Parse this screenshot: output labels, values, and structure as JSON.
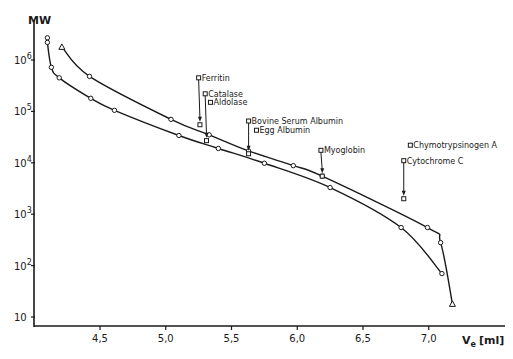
{
  "chart_data": {
    "type": "line",
    "title": "",
    "xlabel": "Ve [ml]",
    "xlabel_main": "V",
    "xlabel_sub": "e",
    "xlabel_unit": "[ml]",
    "ylabel": "MW",
    "yscale": "log",
    "xlim": [
      4.05,
      7.3
    ],
    "ylim": [
      10,
      3000000
    ],
    "grid": false,
    "legend": "none",
    "x_ticks": [
      {
        "value": 4.5,
        "label": "4,5"
      },
      {
        "value": 5.0,
        "label": "5,0"
      },
      {
        "value": 5.5,
        "label": "5,5"
      },
      {
        "value": 6.0,
        "label": "6,0"
      },
      {
        "value": 6.5,
        "label": "6,5"
      },
      {
        "value": 7.0,
        "label": "7,0"
      }
    ],
    "y_ticks": [
      {
        "value": 10,
        "base": "10",
        "exp": ""
      },
      {
        "value": 100,
        "base": "10",
        "exp": "2"
      },
      {
        "value": 1000,
        "base": "10",
        "exp": "3"
      },
      {
        "value": 10000,
        "base": "10",
        "exp": "4"
      },
      {
        "value": 100000,
        "base": "10",
        "exp": "5"
      },
      {
        "value": 1000000,
        "base": "10",
        "exp": "6"
      }
    ],
    "series": [
      {
        "name": "upper curve",
        "marker": "circle",
        "end_marker": "triangle",
        "points": [
          {
            "x": 4.21,
            "y": 1800000,
            "m": "triangle"
          },
          {
            "x": 4.42,
            "y": 480000
          },
          {
            "x": 5.04,
            "y": 70000
          },
          {
            "x": 5.33,
            "y": 35000
          },
          {
            "x": 5.63,
            "y": 17000
          },
          {
            "x": 5.97,
            "y": 8800
          },
          {
            "x": 6.19,
            "y": 5500
          },
          {
            "x": 6.99,
            "y": 550
          },
          {
            "x": 7.09,
            "y": 280
          },
          {
            "x": 7.18,
            "y": 18,
            "m": "triangle"
          }
        ]
      },
      {
        "name": "lower curve",
        "marker": "circle",
        "points": [
          {
            "x": 4.1,
            "y": 2700000
          },
          {
            "x": 4.1,
            "y": 2200000
          },
          {
            "x": 4.13,
            "y": 720000
          },
          {
            "x": 4.19,
            "y": 450000
          },
          {
            "x": 4.43,
            "y": 180000
          },
          {
            "x": 4.61,
            "y": 105000
          },
          {
            "x": 5.1,
            "y": 34000
          },
          {
            "x": 5.4,
            "y": 19000
          },
          {
            "x": 5.75,
            "y": 9800
          },
          {
            "x": 6.25,
            "y": 3300
          },
          {
            "x": 6.79,
            "y": 550
          },
          {
            "x": 7.1,
            "y": 70
          }
        ]
      }
    ],
    "annotations": [
      {
        "label": "Ferritin",
        "label_x": 5.25,
        "label_y": 450000,
        "arrow": true,
        "marker_x": 5.26,
        "marker_y": 55000
      },
      {
        "label": "Catalase",
        "label_x": 5.3,
        "label_y": 220000,
        "arrow": true,
        "marker_x": 5.31,
        "marker_y": 27000
      },
      {
        "label": "Aldolase",
        "label_x": 5.34,
        "label_y": 150000,
        "arrow": false
      },
      {
        "label": "Bovine Serum Albumin",
        "label_x": 5.63,
        "label_y": 65000,
        "arrow": true,
        "marker_x": 5.63,
        "marker_y": 15000
      },
      {
        "label": "Egg Albumin",
        "label_x": 5.69,
        "label_y": 43000,
        "arrow": false
      },
      {
        "label": "Myoglobin",
        "label_x": 6.18,
        "label_y": 17500,
        "arrow": true,
        "marker_x": 6.19,
        "marker_y": 5500
      },
      {
        "label": "Chymotrypsinogen A",
        "label_x": 6.86,
        "label_y": 22000,
        "arrow": false
      },
      {
        "label": "Cytochrome C",
        "label_x": 6.81,
        "label_y": 11000,
        "arrow": true,
        "marker_x": 6.81,
        "marker_y": 2000
      }
    ]
  },
  "colors": {
    "ink": "#1a1a1a",
    "background": "#ffffff"
  }
}
